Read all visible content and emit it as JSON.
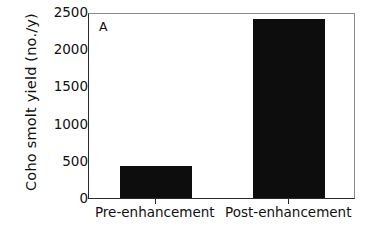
{
  "chart_data": {
    "type": "bar",
    "title": "",
    "panel_label": "A",
    "categories": [
      "Pre-enhancement",
      "Post-enhancement"
    ],
    "values": [
      430,
      2400
    ],
    "xlabel": "",
    "ylabel": "Coho smolt yield (no./y)",
    "ylim": [
      0,
      2500
    ],
    "yticks": [
      0,
      500,
      1000,
      1500,
      2000,
      2500
    ],
    "ytick_labels": [
      "0",
      "500",
      "1000",
      "1500",
      "2000",
      "2500"
    ],
    "grid": false,
    "legend": false,
    "legend_position": "none",
    "bar_color": "#0d0d0d",
    "background_color": "#ffffff",
    "frame_color": "#2a2a2a"
  },
  "axes": {
    "y_title": "Coho smolt yield (no./y)",
    "panel_tag": "A"
  }
}
